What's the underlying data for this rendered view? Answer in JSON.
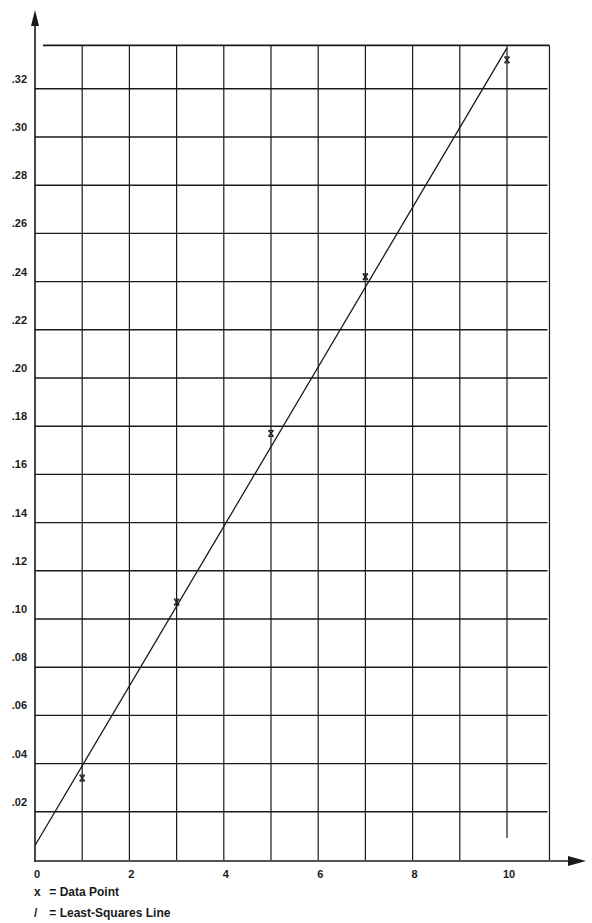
{
  "chart_data": {
    "type": "scatter",
    "title": "",
    "xlabel": "",
    "ylabel": "",
    "xlim": [
      0,
      10.9
    ],
    "ylim": [
      0,
      0.338
    ],
    "grid": true,
    "x_ticks": [
      0,
      2,
      4,
      6,
      8,
      10
    ],
    "x_tick_labels": [
      "0",
      "2",
      "4",
      "6",
      "8",
      "10"
    ],
    "y_ticks": [
      0.02,
      0.04,
      0.06,
      0.08,
      0.1,
      0.12,
      0.14,
      0.16,
      0.18,
      0.2,
      0.22,
      0.24,
      0.26,
      0.28,
      0.3,
      0.32
    ],
    "y_tick_labels": [
      ".02",
      ".04",
      ".06",
      ".08",
      ".10",
      ".12",
      ".14",
      ".16",
      ".18",
      ".20",
      ".22",
      ".24",
      ".26",
      ".28",
      ".30",
      ".32"
    ],
    "series": [
      {
        "name": "Data Point",
        "marker": "x",
        "x": [
          1,
          3,
          5,
          7,
          10
        ],
        "y": [
          0.034,
          0.107,
          0.177,
          0.242,
          0.332
        ]
      },
      {
        "name": "Least-Squares Line",
        "type": "line",
        "x": [
          0,
          10
        ],
        "y": [
          0.006,
          0.337
        ]
      }
    ],
    "legend": [
      {
        "symbol": "x",
        "label": "= Data Point"
      },
      {
        "symbol": "/",
        "label": "= Least-Squares Line"
      }
    ],
    "legend_position": "bottom-left"
  },
  "colors": {
    "ink": "#1a1a1a",
    "background": "#ffffff"
  }
}
